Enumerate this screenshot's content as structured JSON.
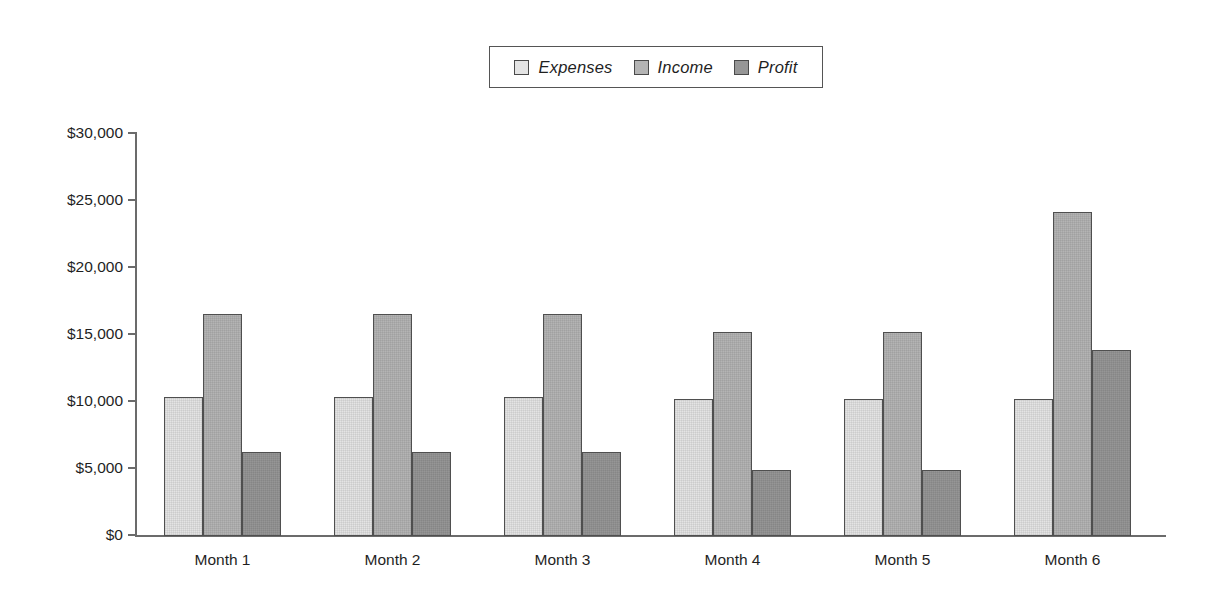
{
  "chart_data": {
    "type": "bar",
    "title": "",
    "subtitle": "",
    "xlabel": "",
    "ylabel": "",
    "categories": [
      "Month 1",
      "Month 2",
      "Month 3",
      "Month 4",
      "Month 5",
      "Month 6"
    ],
    "series": [
      {
        "name": "Expenses",
        "color": "#e4e4e4",
        "values": [
          10400,
          10400,
          10350,
          10250,
          10200,
          10200
        ]
      },
      {
        "name": "Income",
        "color": "#b4b4b4",
        "values": [
          16600,
          16600,
          16550,
          15250,
          15200,
          24200
        ]
      },
      {
        "name": "Profit",
        "color": "#969696",
        "values": [
          6300,
          6300,
          6250,
          4950,
          4900,
          13850
        ]
      }
    ],
    "ylim": [
      0,
      30000
    ],
    "yticks": [
      0,
      5000,
      10000,
      15000,
      20000,
      25000,
      30000
    ],
    "ytick_labels": [
      "$0",
      "$5,000",
      "$10,000",
      "$15,000",
      "$20,000",
      "$25,000",
      "$30,000"
    ],
    "grid": false,
    "legend_position": "top-center",
    "legend_entries": [
      "Expenses",
      "Income",
      "Profit"
    ]
  },
  "legend": {
    "items": [
      {
        "label": "Expenses",
        "swatch_color": "#e4e4e4"
      },
      {
        "label": "Income",
        "swatch_color": "#b4b4b4"
      },
      {
        "label": "Profit",
        "swatch_color": "#969696"
      }
    ]
  },
  "axes": {
    "y_max": 30000,
    "y_min": 0,
    "tick_step": 5000
  }
}
